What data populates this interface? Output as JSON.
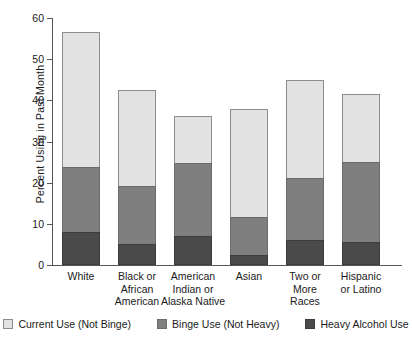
{
  "chart_data": {
    "type": "bar",
    "stacked": true,
    "title": "",
    "xlabel": "",
    "ylabel": "Percent Using in Past Month",
    "ylim": [
      0,
      60
    ],
    "yticks": [
      0,
      10,
      20,
      30,
      40,
      50,
      60
    ],
    "grid": false,
    "legend_position": "bottom",
    "categories": [
      "White",
      "Black or African American",
      "American Indian or Alaska Native",
      "Asian",
      "Two or More Races",
      "Hispanic or Latino"
    ],
    "category_label_lines": [
      [
        "White"
      ],
      [
        "Black or",
        "African",
        "American"
      ],
      [
        "American",
        "Indian or",
        "Alaska Native"
      ],
      [
        "Asian"
      ],
      [
        "Two or",
        "More",
        "Races"
      ],
      [
        "Hispanic",
        "or Latino"
      ]
    ],
    "series": [
      {
        "name": "Heavy Alcohol Use",
        "color": "#4a4a4a",
        "values": [
          8.0,
          5.0,
          7.0,
          2.5,
          6.0,
          5.6
        ]
      },
      {
        "name": "Binge Use (Not Heavy)",
        "color": "#7f7f7f",
        "values": [
          16.0,
          14.5,
          18.0,
          9.5,
          15.5,
          19.7
        ]
      },
      {
        "name": "Current Use (Not Binge)",
        "color": "#e2e2e2",
        "values": [
          33.0,
          23.5,
          11.7,
          26.5,
          24.0,
          16.7
        ]
      }
    ],
    "totals": [
      57.0,
      43.0,
      36.7,
      38.5,
      45.5,
      42.0
    ],
    "cumulative": {
      "heavy_top": [
        8.0,
        5.0,
        7.0,
        2.5,
        6.0,
        5.6
      ],
      "binge_top": [
        24.0,
        19.5,
        25.0,
        12.0,
        21.5,
        25.3
      ],
      "bar_top": [
        57.0,
        43.0,
        36.7,
        38.5,
        45.5,
        42.0
      ]
    },
    "legend": [
      {
        "label": "Current Use (Not Binge)",
        "key": "current"
      },
      {
        "label": "Binge Use (Not Heavy)",
        "key": "binge"
      },
      {
        "label": "Heavy Alcohol Use",
        "key": "heavy"
      }
    ]
  }
}
